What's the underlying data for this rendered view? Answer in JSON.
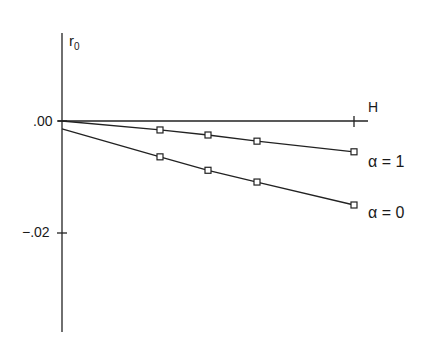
{
  "chart_data": {
    "type": "line",
    "title": "",
    "xlabel": "H",
    "ylabel": "r0",
    "ylabel_main": "r",
    "ylabel_sub": "0",
    "yticks": [
      ".00",
      "-.02"
    ],
    "ylim": [
      -0.038,
      0.019
    ],
    "x": [
      0,
      0.5,
      0.75,
      1.0,
      1.5
    ],
    "x_marker_positions_note": "",
    "series": [
      {
        "name": "α = 1",
        "label": "α = 1",
        "x": [
          0,
          0.5,
          0.75,
          1.0,
          1.5
        ],
        "values": [
          0.0,
          -0.0016,
          -0.0025,
          -0.0036,
          -0.0055
        ],
        "marker": "square"
      },
      {
        "name": "α = 0",
        "label": "α = 0",
        "x": [
          0,
          0.5,
          0.75,
          1.0,
          1.5
        ],
        "values": [
          -0.0014,
          -0.0064,
          -0.0088,
          -0.0109,
          -0.015
        ],
        "marker": "square"
      }
    ],
    "grid": false,
    "legend": "inline labels at line ends"
  },
  "labels": {
    "y_axis_r": "r",
    "y_axis_sub": "0",
    "tick_zero": ".00",
    "tick_neg02": "−.02",
    "x_axis": "H",
    "series_a1": "α = 1",
    "series_a0": "α = 0"
  }
}
